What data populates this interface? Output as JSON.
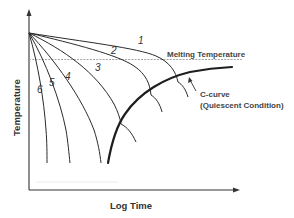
{
  "diagram": {
    "type": "cooling-curves-with-crystallization-c-curve",
    "axes": {
      "x_label": "Log Time",
      "y_label": "Temperature"
    },
    "reference_line": {
      "label": "Melting Temperature",
      "style": "dashed"
    },
    "curves": [
      {
        "id": "1",
        "label": "1"
      },
      {
        "id": "2",
        "label": "2"
      },
      {
        "id": "3",
        "label": "3"
      },
      {
        "id": "4",
        "label": "4"
      },
      {
        "id": "5",
        "label": "5"
      },
      {
        "id": "6",
        "label": "6"
      }
    ],
    "c_curve": {
      "label_line1": "C-curve",
      "label_line2": "(Quiescent Condition)"
    },
    "colors": {
      "line": "#2b2b2b",
      "axis": "#333333",
      "dashed": "#9a9a9a",
      "background": "#ffffff"
    }
  }
}
